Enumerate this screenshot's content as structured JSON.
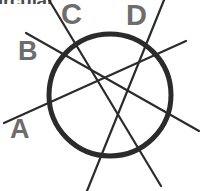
{
  "canvas": {
    "width": 202,
    "height": 191,
    "background": "#ffffff"
  },
  "title_fragment": {
    "text": "ircular",
    "note": "top edge of the word is cropped off by the top of the image",
    "color": "#4a4a4a"
  },
  "figure": {
    "type": "circle-with-secant-lines",
    "stroke_color": "#2b2b2b",
    "label_color": "#6d6d6d",
    "circle": {
      "cx": 110,
      "cy": 95,
      "r": 61,
      "stroke_width": 5,
      "fill": "none"
    },
    "lines": [
      {
        "label": "A",
        "x1": 4,
        "y1": 123,
        "x2": 186,
        "y2": 41,
        "stroke_width": 2.2
      },
      {
        "label": "B",
        "x1": 26,
        "y1": 33,
        "x2": 199,
        "y2": 131,
        "stroke_width": 2.2
      },
      {
        "label": "C",
        "x1": 49,
        "y1": 0,
        "x2": 161,
        "y2": 186,
        "stroke_width": 2.2
      },
      {
        "label": "D",
        "x1": 164,
        "y1": 0,
        "x2": 87,
        "y2": 191,
        "stroke_width": 2.2
      }
    ],
    "labels": [
      {
        "id": "a",
        "text": "A"
      },
      {
        "id": "b",
        "text": "B"
      },
      {
        "id": "c",
        "text": "C"
      },
      {
        "id": "d",
        "text": "D"
      }
    ]
  }
}
